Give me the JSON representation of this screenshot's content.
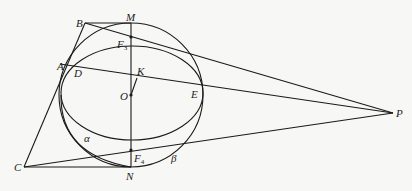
{
  "diagram": {
    "type": "geometry",
    "points": {
      "B": {
        "label": "B",
        "x": 85,
        "y": 23
      },
      "M": {
        "label": "M",
        "x": 131,
        "y": 23
      },
      "F3": {
        "label": "F",
        "sub": "3",
        "x": 131,
        "y": 37
      },
      "A": {
        "label": "A",
        "x": 68,
        "y": 65
      },
      "D": {
        "label": "D",
        "x": 79,
        "y": 69
      },
      "K": {
        "label": "K",
        "x": 137,
        "y": 76
      },
      "O": {
        "label": "O",
        "x": 131,
        "y": 95
      },
      "E": {
        "label": "E",
        "x": 201,
        "y": 88
      },
      "P": {
        "label": "P",
        "x": 393,
        "y": 113
      },
      "C": {
        "label": "C",
        "x": 24,
        "y": 167
      },
      "N": {
        "label": "N",
        "x": 131,
        "y": 167
      },
      "F4": {
        "label": "F",
        "sub": "4",
        "x": 131,
        "y": 150
      }
    },
    "curve_labels": {
      "alpha": "α",
      "beta": "β"
    },
    "colors": {
      "stroke": "#1a1a1a",
      "background": "#f7f7f5"
    }
  }
}
